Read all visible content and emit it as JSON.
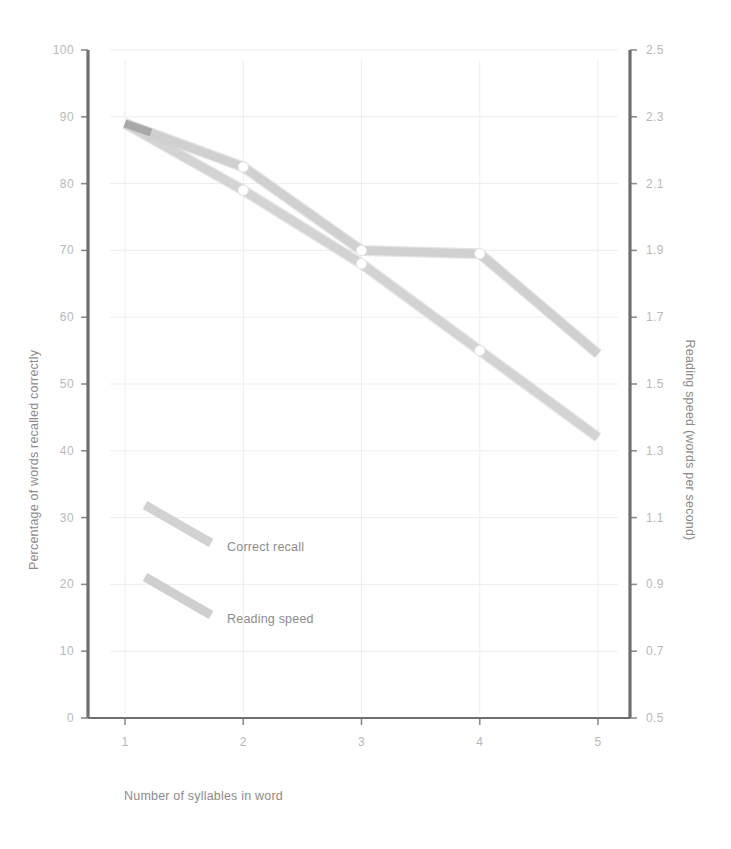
{
  "figure": {
    "background": "#ffffff",
    "left_axis_title": "Percentage of words recalled correctly",
    "right_axis_title": "Reading speed (words per second)",
    "x_axis_title": "Number of syllables in word"
  },
  "colors": {
    "correct_recall": "#d2d2d2",
    "reading_speed": "#cfcfcf",
    "axis": "#6f6f6f",
    "tick_text": "#b9b9b9",
    "grid": "#ededed",
    "title_text": "#8c8c8c"
  },
  "legend": {
    "position": "inside-lower-left",
    "entries": [
      {
        "label": "Correct recall",
        "color": "#d2d2d2"
      },
      {
        "label": "Reading speed",
        "color": "#cfcfcf"
      }
    ]
  },
  "axes": {
    "left": {
      "label": "Percentage of words recalled correctly",
      "min": 0,
      "max": 100,
      "step": 10,
      "ticks": [
        "0",
        "10",
        "20",
        "30",
        "40",
        "50",
        "60",
        "70",
        "80",
        "90",
        "100"
      ]
    },
    "right": {
      "label": "Reading speed (words per second)",
      "min": 0.5,
      "max": 2.5,
      "step": 0.2,
      "ticks": [
        "0.5",
        "0.7",
        "0.9",
        "1.1",
        "1.3",
        "1.5",
        "1.7",
        "1.9",
        "2.1",
        "2.3",
        "2.5"
      ]
    },
    "x": {
      "label": "Number of syllables in word",
      "ticks": [
        "1",
        "2",
        "3",
        "4",
        "5"
      ]
    }
  },
  "chart_data": {
    "type": "line",
    "title": "",
    "xlabel": "Number of syllables in word",
    "ylabel": "Percentage of words recalled correctly",
    "y2label": "Reading speed (words per second)",
    "categories": [
      "1",
      "2",
      "3",
      "4",
      "5"
    ],
    "x": [
      1,
      2,
      3,
      4,
      5
    ],
    "xlim": [
      0.7,
      5.3
    ],
    "ylim": [
      0,
      100
    ],
    "y2lim": [
      0.5,
      2.5
    ],
    "grid": true,
    "legend_position": "inside-lower-left",
    "series": [
      {
        "name": "Correct recall",
        "axis": "left",
        "color": "#d2d2d2",
        "values": [
          89,
          79,
          68,
          55,
          42
        ]
      },
      {
        "name": "Reading speed",
        "axis": "right",
        "color": "#cfcfcf",
        "values": [
          2.28,
          2.15,
          1.9,
          1.89,
          1.59
        ]
      }
    ]
  }
}
